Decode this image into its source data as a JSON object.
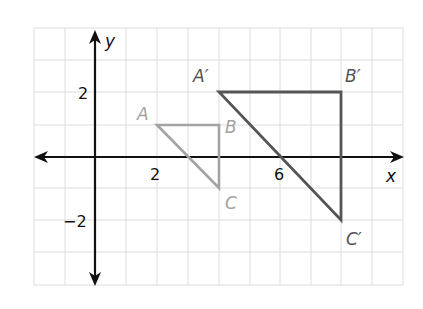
{
  "diagram": {
    "type": "coordinate-plane",
    "axes": {
      "x_label": "x",
      "y_label": "y"
    },
    "tick_labels": {
      "x": [
        {
          "value": 2,
          "text": "2"
        },
        {
          "value": 6,
          "text": "6"
        }
      ],
      "y": [
        {
          "value": 2,
          "text": "2"
        },
        {
          "value": -2,
          "text": "−2"
        }
      ]
    },
    "grid": {
      "x_range": [
        -2,
        10
      ],
      "y_range": [
        -4,
        4
      ]
    },
    "original_triangle": {
      "color": "#a3a3a3",
      "vertices": [
        {
          "name": "A",
          "x": 2,
          "y": 1
        },
        {
          "name": "B",
          "x": 4,
          "y": 1
        },
        {
          "name": "C",
          "x": 4,
          "y": -1
        }
      ]
    },
    "image_triangle": {
      "color": "#555555",
      "vertices": [
        {
          "name": "A′",
          "x": 4,
          "y": 2
        },
        {
          "name": "B′",
          "x": 8,
          "y": 2
        },
        {
          "name": "C′",
          "x": 8,
          "y": -2
        }
      ]
    }
  }
}
